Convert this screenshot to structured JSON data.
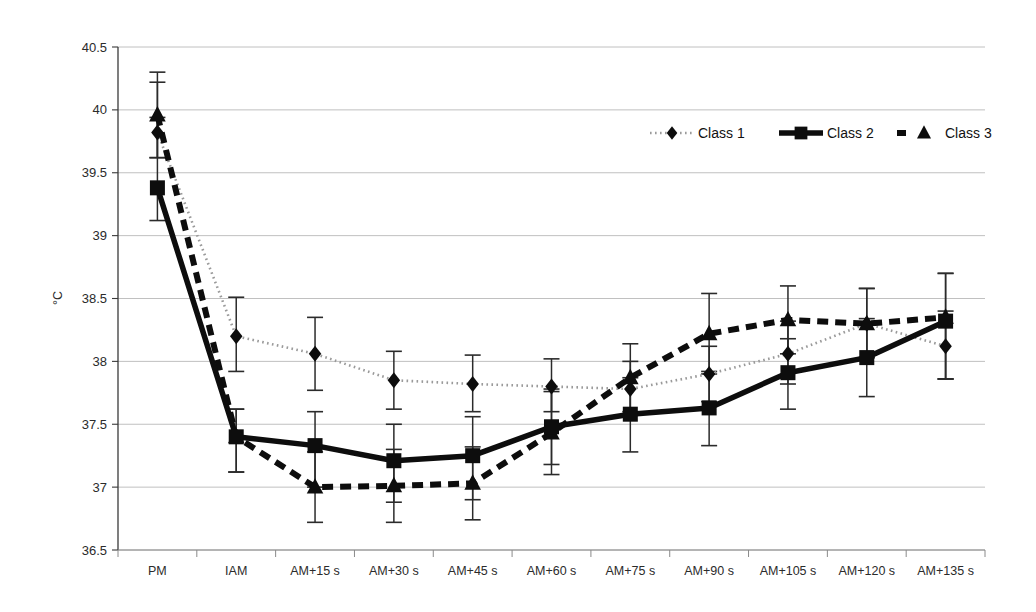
{
  "chart_data": {
    "type": "line",
    "title": "",
    "subtitle": "",
    "xlabel": "",
    "ylabel": "°C",
    "ylim": [
      36.5,
      40.5
    ],
    "ytick_step": 0.5,
    "yticks": [
      "36.5",
      "37",
      "37.5",
      "38",
      "38.5",
      "39",
      "39.5",
      "40",
      "40.5"
    ],
    "grid": true,
    "legend_position": "top-right",
    "categories": [
      "PM",
      "IAM",
      "AM+15 s",
      "AM+30 s",
      "AM+45 s",
      "AM+60 s",
      "AM+75 s",
      "AM+90 s",
      "AM+105 s",
      "AM+120 s",
      "AM+135 s"
    ],
    "series": [
      {
        "name": "Class 1",
        "marker": "diamond",
        "line_style": "dotted",
        "color": "#111111",
        "values": [
          39.82,
          38.2,
          38.06,
          37.85,
          37.82,
          37.8,
          37.78,
          37.9,
          38.06,
          38.3,
          38.12
        ],
        "err_low": [
          39.62,
          37.92,
          37.77,
          37.62,
          37.6,
          37.6,
          37.58,
          37.68,
          37.82,
          38.03,
          37.86
        ],
        "err_high": [
          40.22,
          38.51,
          38.35,
          38.08,
          38.05,
          38.02,
          38.0,
          38.12,
          38.32,
          38.58,
          38.4
        ]
      },
      {
        "name": "Class 2",
        "marker": "square",
        "line_style": "solid",
        "color": "#111111",
        "values": [
          39.38,
          37.4,
          37.33,
          37.21,
          37.25,
          37.48,
          37.58,
          37.63,
          37.91,
          38.03,
          38.32
        ],
        "err_low": [
          39.12,
          37.12,
          37.0,
          36.88,
          36.9,
          37.18,
          37.28,
          37.33,
          37.62,
          37.72,
          37.86
        ],
        "err_high": [
          39.94,
          37.62,
          37.6,
          37.5,
          37.56,
          37.78,
          37.87,
          37.92,
          38.18,
          38.34,
          38.7
        ]
      },
      {
        "name": "Class 3",
        "marker": "triangle",
        "line_style": "dashed",
        "color": "#111111",
        "values": [
          39.96,
          37.4,
          37.0,
          37.01,
          37.03,
          37.43,
          37.87,
          38.22,
          38.33,
          38.3,
          38.35
        ],
        "err_low": [
          39.62,
          37.12,
          36.72,
          36.72,
          36.74,
          37.1,
          37.6,
          37.9,
          38.06,
          38.03,
          37.86
        ],
        "err_high": [
          40.3,
          37.62,
          37.28,
          37.3,
          37.32,
          37.76,
          38.14,
          38.54,
          38.6,
          38.58,
          38.7
        ]
      }
    ]
  },
  "legend": {
    "entries": [
      {
        "label": "Class 1"
      },
      {
        "label": "Class 2"
      },
      {
        "label": "Class 3"
      }
    ]
  }
}
